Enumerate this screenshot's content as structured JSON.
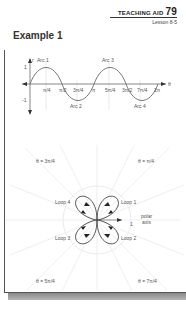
{
  "header": {
    "label": "TEACHING AID",
    "number": "79",
    "lesson": "Lesson 8-5"
  },
  "example_title": "Example 1",
  "sine_graph": {
    "y_axis_label": "r",
    "x_axis_label": "θ",
    "y_ticks": [
      "1",
      "-1"
    ],
    "x_ticks": [
      "π/4",
      "π/2",
      "3π/4",
      "π",
      "5π/4",
      "3π/2",
      "7π/4",
      "2π"
    ],
    "arcs": [
      "Arc 1",
      "Arc 2",
      "Arc 3",
      "Arc 4"
    ]
  },
  "polar_graph": {
    "loops": [
      "Loop 1",
      "Loop 2",
      "Loop 3",
      "Loop 4"
    ],
    "axis_label_line1": "polar",
    "axis_label_line2": "axis",
    "radius_tick": "1",
    "angle_labels": {
      "top_left": "θ = 3π/4",
      "top_right": "θ = π/4",
      "bottom_left": "θ = 5π/4",
      "bottom_right": "θ = 7π/4"
    }
  }
}
